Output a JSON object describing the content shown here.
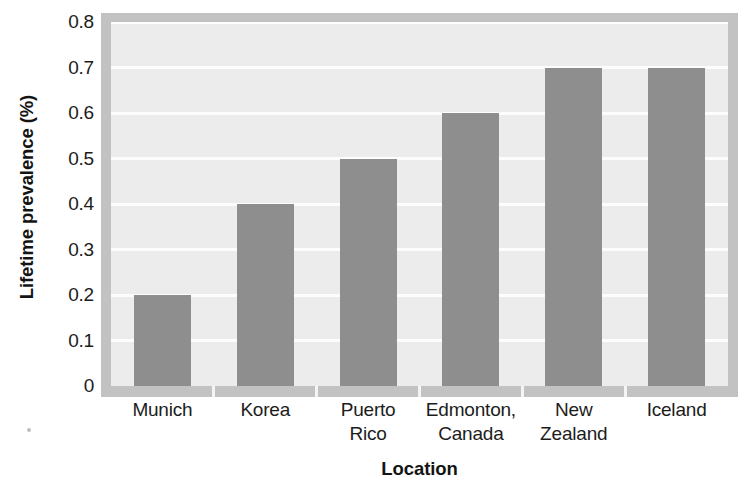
{
  "chart_data": {
    "type": "bar",
    "title": "",
    "xlabel": "Location",
    "ylabel": "Lifetime prevalence (%)",
    "categories": [
      "Munich",
      "Korea",
      "Puerto Rico",
      "Edmonton, Canada",
      "New Zealand",
      "Iceland"
    ],
    "category_lines": [
      [
        "Munich"
      ],
      [
        "Korea"
      ],
      [
        "Puerto",
        "Rico"
      ],
      [
        "Edmonton,",
        "Canada"
      ],
      [
        "New",
        "Zealand"
      ],
      [
        "Iceland"
      ]
    ],
    "values": [
      0.2,
      0.4,
      0.5,
      0.6,
      0.7,
      0.7
    ],
    "ylim": [
      0,
      0.8
    ],
    "ytick_labels": [
      "0.8",
      "0.7",
      "0.6",
      "0.5",
      "0.4",
      "0.3",
      "0.2",
      "0.1",
      "0"
    ],
    "ytick_values": [
      0.8,
      0.7,
      0.6,
      0.5,
      0.4,
      0.3,
      0.2,
      0.1,
      0
    ],
    "grid": true,
    "grid_orientation": "horizontal",
    "legend": "none",
    "colors": {
      "bar": "#8e8e8e",
      "plot_background": "#ececec",
      "frame": "#c2c2c2",
      "gridline": "#fdfdfd",
      "text": "#1c1c1c",
      "page_background": "#ffffff"
    }
  }
}
